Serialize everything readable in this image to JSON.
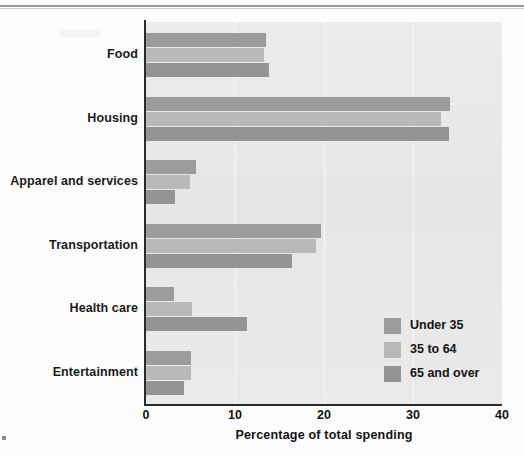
{
  "chart_data": {
    "type": "bar",
    "orientation": "horizontal",
    "title": "",
    "xlabel": "Percentage of total spending",
    "ylabel": "",
    "xlim": [
      0,
      40
    ],
    "xticks": [
      "0",
      "10",
      "20",
      "30",
      "40"
    ],
    "grid": "vertical",
    "legend_position": "inside-lower-right",
    "categories": [
      "Food",
      "Housing",
      "Apparel and services",
      "Transportation",
      "Health care",
      "Entertainment"
    ],
    "series": [
      {
        "name": "Under 35",
        "color": "#9c9c9c",
        "values": [
          13.5,
          34.2,
          5.6,
          19.7,
          3.2,
          5.1
        ]
      },
      {
        "name": "35 to 64",
        "color": "#b9b9b9",
        "values": [
          13.3,
          33.1,
          4.9,
          19.1,
          5.2,
          5.1
        ]
      },
      {
        "name": "65 and over",
        "color": "#949494",
        "values": [
          13.8,
          34.1,
          3.3,
          16.4,
          11.3,
          4.3
        ]
      }
    ]
  },
  "legend": {
    "items": [
      {
        "label": "Under 35"
      },
      {
        "label": "35 to 64"
      },
      {
        "label": "65 and over"
      }
    ]
  },
  "axis": {
    "x_title": "Percentage of total spending"
  },
  "colors": {
    "plot_background": "#e9e9e9",
    "gridline": "#f7f7f7",
    "axis": "#2b2b2b",
    "series_under35": "#9c9c9c",
    "series_35to64": "#b9b9b9",
    "series_65over": "#949494"
  }
}
